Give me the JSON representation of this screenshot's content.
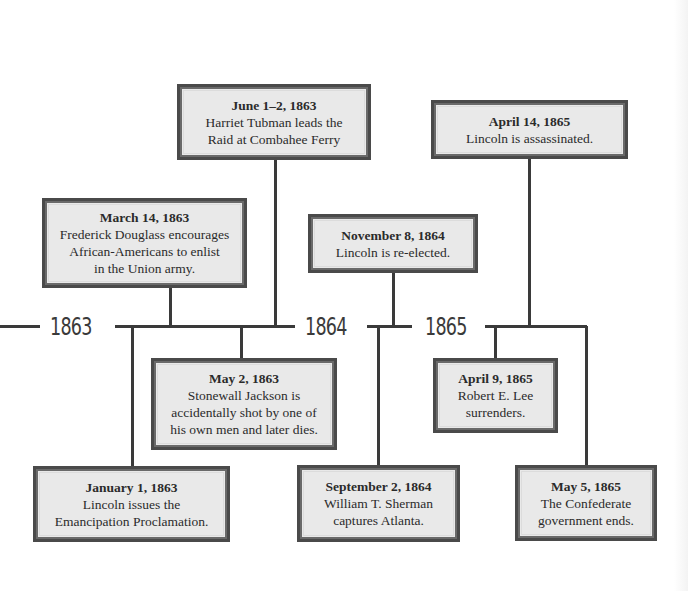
{
  "diagram": {
    "type": "timeline",
    "colors": {
      "line": "#3a3a3a",
      "box_border": "#4a4a4a",
      "box_fill": "#e9e9e9",
      "text": "#2b2b2b"
    },
    "years": [
      {
        "label": "1863"
      },
      {
        "label": "1864"
      },
      {
        "label": "1865"
      }
    ],
    "events": [
      {
        "date": "June 1–2, 1863",
        "description": "Harriet Tubman leads the\nRaid at Combahee Ferry",
        "position": "above"
      },
      {
        "date": "March 14, 1863",
        "description": "Frederick Douglass encourages\nAfrican-Americans to enlist\nin the Union army.",
        "position": "above"
      },
      {
        "date": "November 8, 1864",
        "description": "Lincoln is re-elected.",
        "position": "above"
      },
      {
        "date": "April 14, 1865",
        "description": "Lincoln is assassinated.",
        "position": "above"
      },
      {
        "date": "May 2, 1863",
        "description": "Stonewall Jackson is\naccidentally shot by one of\nhis own men and later dies.",
        "position": "below"
      },
      {
        "date": "April 9, 1865",
        "description": "Robert E. Lee\nsurrenders.",
        "position": "below"
      },
      {
        "date": "January 1, 1863",
        "description": "Lincoln issues the\nEmancipation Proclamation.",
        "position": "below"
      },
      {
        "date": "September 2, 1864",
        "description": "William T. Sherman\ncaptures Atlanta.",
        "position": "below"
      },
      {
        "date": "May 5, 1865",
        "description": "The Confederate\ngovernment ends.",
        "position": "below"
      }
    ]
  }
}
